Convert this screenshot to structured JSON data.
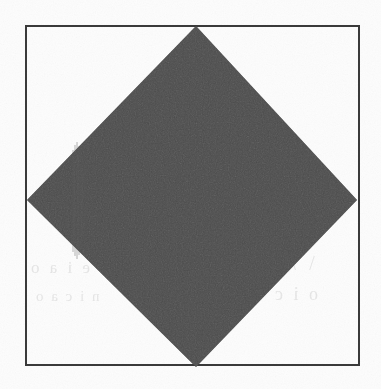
{
  "figure": {
    "title": "",
    "caption": "",
    "media": "scanned-page",
    "page_background_color": "#fdfdfd",
    "ink_color": "#2a2a2a",
    "border_color": "#3a3a3a"
  },
  "border_frame": {
    "name": "rectangular-border",
    "x": 25,
    "y": 25,
    "width": 335,
    "height": 341,
    "stroke_width_px": 2,
    "stroke_color": "#3a3a3a",
    "fill": "none"
  },
  "diamond": {
    "name": "solid-diamond",
    "shape": "rotated-square",
    "fill_color": "#2a2a2a",
    "rotation_deg": 45,
    "vertices": {
      "top": [
        196,
        26
      ],
      "right": [
        357,
        200
      ],
      "bottom": [
        196,
        367
      ],
      "left": [
        27,
        200
      ]
    },
    "polygon_points": "196,26 357,200 196,367 27,200"
  },
  "artifacts": {
    "scan_streaks": {
      "name": "vertical-scan-streaks",
      "orientation": "vertical",
      "x_range": [
        72,
        86
      ],
      "y_range": [
        140,
        262
      ],
      "color": "#4f4f4f"
    },
    "ghost_text": {
      "name": "bleed-through-ghost-text",
      "legible": false,
      "left_upper": "e i a o",
      "left_lower": "n i c a o",
      "right_upper": "\\ / \\",
      "right_lower": "o i c",
      "mid_upper": "r a"
    },
    "paper_grain": {
      "name": "paper-grain-noise",
      "opacity": 0.5
    }
  }
}
